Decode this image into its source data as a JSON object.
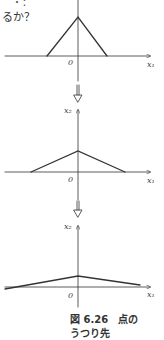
{
  "text": {
    "top_fragment": "・：",
    "question": "るか？"
  },
  "plots": [
    {
      "origin_label": "0",
      "x_label": "x₁",
      "y_label": ""
    },
    {
      "origin_label": "0",
      "x_label": "x₁",
      "y_label": "x₂"
    },
    {
      "origin_label": "0",
      "x_label": "x₁",
      "y_label": "x₂"
    }
  ],
  "caption": {
    "line1": "図 6.26　点の",
    "line2": "うつり先"
  },
  "colors": {
    "line": "#333333",
    "background": "#ffffff"
  }
}
